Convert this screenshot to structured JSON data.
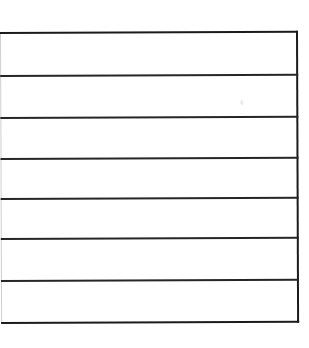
{
  "document": {
    "kind": "scanned-blank-table",
    "title": "Blank ruled table",
    "background_color": "#ffffff",
    "rule_color": "#1b1b1b",
    "faint_edge_color": "#cfcfcf",
    "rule_thickness_px": 2,
    "row_count": 7,
    "column_count": 1,
    "has_header_row": false,
    "column_headers": [],
    "rows": [
      {
        "label": "row-1",
        "cells": [
          ""
        ]
      },
      {
        "label": "row-2",
        "cells": [
          ""
        ]
      },
      {
        "label": "row-3",
        "cells": [
          ""
        ]
      },
      {
        "label": "row-4",
        "cells": [
          ""
        ]
      },
      {
        "label": "row-5",
        "cells": [
          ""
        ]
      },
      {
        "label": "row-6",
        "cells": [
          ""
        ]
      },
      {
        "label": "row-7",
        "cells": [
          ""
        ]
      }
    ],
    "geometry": {
      "block_left_px": 0,
      "block_top_px": 32,
      "block_width_px": 298,
      "block_height_px": 292,
      "skew_degrees": -0.22,
      "rule_offsets_px": [
        0,
        43,
        85,
        126,
        166,
        206,
        248,
        290
      ],
      "right_border_x_px": 296,
      "left_edge_x_px": 0
    },
    "artifacts": [
      {
        "name": "scanner-speck",
        "x_px": 240,
        "y_px": 101,
        "width_px": 3,
        "height_px": 5
      }
    ]
  }
}
